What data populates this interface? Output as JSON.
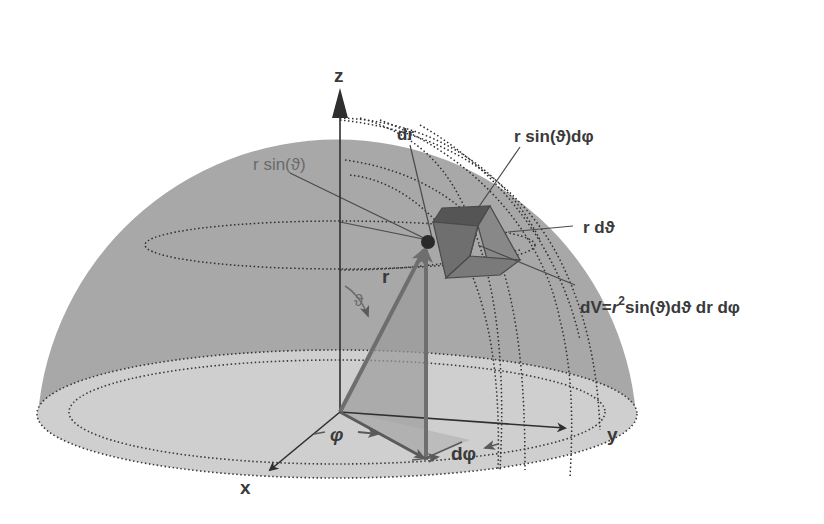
{
  "diagram": {
    "colors": {
      "background": "#ffffff",
      "hemisphere": "#a8a8a8",
      "base_disc": "#cfcfcf",
      "axis": "#2f2f2f",
      "vector": "#6e6e6e",
      "cube_dark": "#5c5c5c",
      "cube_mid": "#7d7d7d",
      "label_dark": "#3a3a3a",
      "label_light": "#6a6a6a"
    },
    "axes": {
      "z_label": "z",
      "x_label": "x",
      "y_label": "y"
    },
    "labels": {
      "dr": "dr",
      "r_sin_theta": "r sin(ϑ)",
      "r_sin_theta_dphi": "r sin(ϑ)dφ",
      "r_dtheta": "r dϑ",
      "dV_prefix": "dV=",
      "dV_r": "r",
      "dV_sup": "2",
      "dV_rest": "sin(ϑ)dϑ dr dφ",
      "r_vector": "r",
      "theta_angle": "ϑ",
      "phi_angle": "φ",
      "dphi": "dφ"
    },
    "icons": {
      "volume_element": "cube-icon",
      "point": "sphere-point-icon"
    }
  }
}
